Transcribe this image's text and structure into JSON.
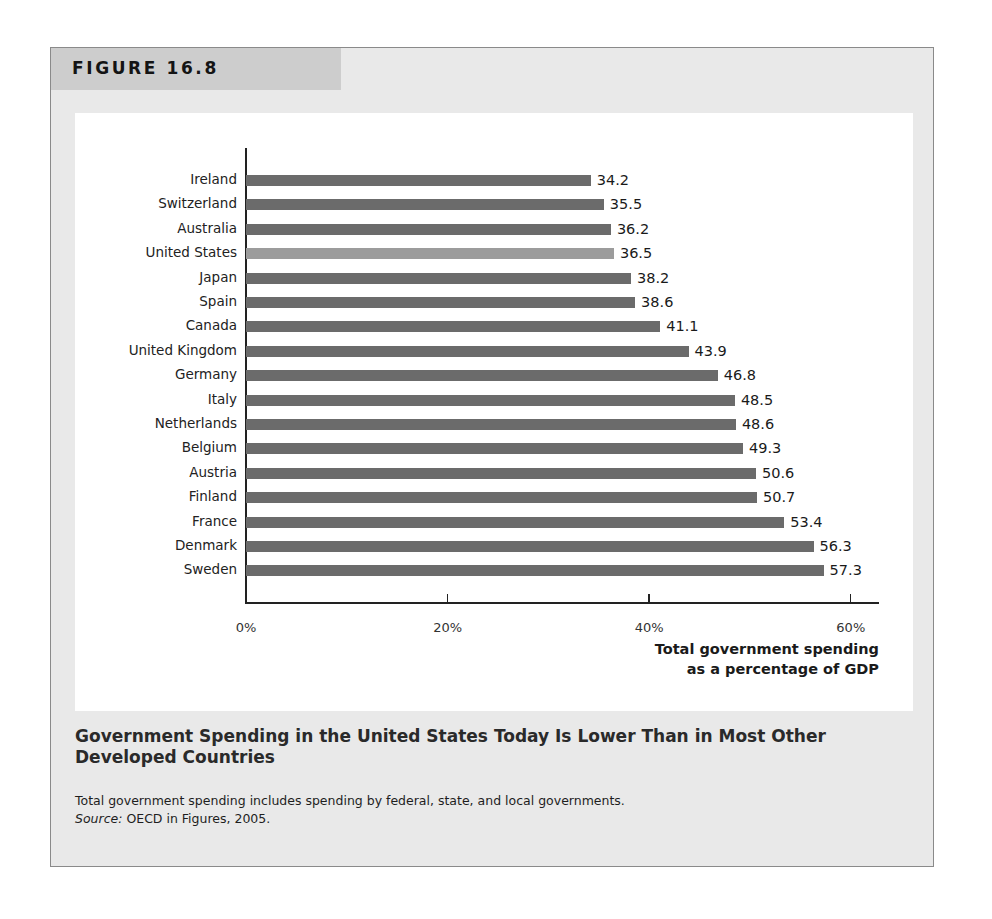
{
  "figure": {
    "label": "FIGURE 16.8",
    "caption_title": "Government Spending in the United States Today Is Lower Than in Most Other Developed Countries",
    "note": "Total government spending includes spending by federal, state, and local governments.",
    "source_label": "Source:",
    "source_text": " OECD in Figures, 2005."
  },
  "colors": {
    "bar": "#6b6b6b",
    "highlight_bar": "#9c9c9c",
    "panel_bg": "#e9e9e9",
    "tab_bg": "#cdcdcd"
  },
  "chart_data": {
    "type": "bar",
    "orientation": "horizontal",
    "title": "Government Spending in the United States Today Is Lower Than in Most Other Developed Countries",
    "xlabel": "Total government spending as a percentage of GDP",
    "xlabel_lines": [
      "Total government spending",
      "as a percentage of GDP"
    ],
    "ylabel": "",
    "xlim": [
      0,
      63
    ],
    "xticks": [
      0,
      20,
      40,
      60
    ],
    "xtick_labels": [
      "0%",
      "20%",
      "40%",
      "60%"
    ],
    "grid": false,
    "legend": null,
    "highlight": "United States",
    "categories": [
      "Ireland",
      "Switzerland",
      "Australia",
      "United States",
      "Japan",
      "Spain",
      "Canada",
      "United Kingdom",
      "Germany",
      "Italy",
      "Netherlands",
      "Belgium",
      "Austria",
      "Finland",
      "France",
      "Denmark",
      "Sweden"
    ],
    "values": [
      34.2,
      35.5,
      36.2,
      36.5,
      38.2,
      38.6,
      41.1,
      43.9,
      46.8,
      48.5,
      48.6,
      49.3,
      50.6,
      50.7,
      53.4,
      56.3,
      57.3
    ],
    "value_labels": [
      "34.2",
      "35.5",
      "36.2",
      "36.5",
      "38.2",
      "38.6",
      "41.1",
      "43.9",
      "46.8",
      "48.5",
      "48.6",
      "49.3",
      "50.6",
      "50.7",
      "53.4",
      "56.3",
      "57.3"
    ]
  }
}
